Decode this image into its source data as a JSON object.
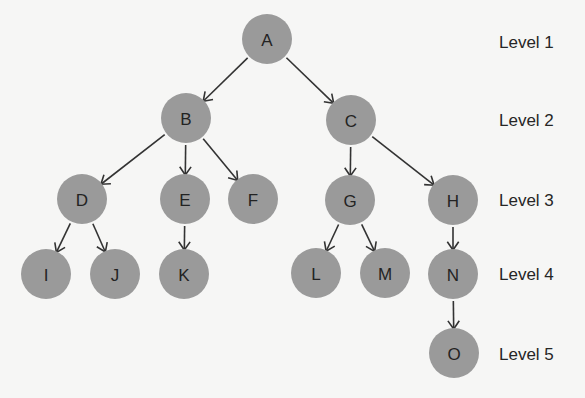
{
  "diagram": {
    "type": "tree",
    "node_radius": 25,
    "colors": {
      "background": "#f6f6f5",
      "node_fill": "#9a9a9a",
      "node_text": "#232323",
      "edge": "#333333",
      "label_text": "#262626"
    },
    "nodes": [
      {
        "id": "A",
        "label": "A",
        "level": 1,
        "x": 267,
        "y": 39
      },
      {
        "id": "B",
        "label": "B",
        "level": 2,
        "x": 186,
        "y": 118
      },
      {
        "id": "C",
        "label": "C",
        "level": 2,
        "x": 351,
        "y": 120
      },
      {
        "id": "D",
        "label": "D",
        "level": 3,
        "x": 82,
        "y": 199
      },
      {
        "id": "E",
        "label": "E",
        "level": 3,
        "x": 185,
        "y": 199
      },
      {
        "id": "F",
        "label": "F",
        "level": 3,
        "x": 253,
        "y": 199
      },
      {
        "id": "G",
        "label": "G",
        "level": 3,
        "x": 350,
        "y": 200
      },
      {
        "id": "H",
        "label": "H",
        "level": 3,
        "x": 453,
        "y": 200
      },
      {
        "id": "I",
        "label": "I",
        "level": 4,
        "x": 46,
        "y": 274
      },
      {
        "id": "J",
        "label": "J",
        "level": 4,
        "x": 115,
        "y": 274
      },
      {
        "id": "K",
        "label": "K",
        "level": 4,
        "x": 184,
        "y": 274
      },
      {
        "id": "L",
        "label": "L",
        "level": 4,
        "x": 316,
        "y": 273
      },
      {
        "id": "M",
        "label": "M",
        "level": 4,
        "x": 385,
        "y": 273
      },
      {
        "id": "N",
        "label": "N",
        "level": 4,
        "x": 453,
        "y": 274
      },
      {
        "id": "O",
        "label": "O",
        "level": 5,
        "x": 454,
        "y": 353
      }
    ],
    "edges": [
      {
        "from": "A",
        "to": "B"
      },
      {
        "from": "A",
        "to": "C"
      },
      {
        "from": "B",
        "to": "D"
      },
      {
        "from": "B",
        "to": "E"
      },
      {
        "from": "B",
        "to": "F"
      },
      {
        "from": "C",
        "to": "G"
      },
      {
        "from": "C",
        "to": "H"
      },
      {
        "from": "D",
        "to": "I"
      },
      {
        "from": "D",
        "to": "J"
      },
      {
        "from": "E",
        "to": "K"
      },
      {
        "from": "G",
        "to": "L"
      },
      {
        "from": "G",
        "to": "M"
      },
      {
        "from": "H",
        "to": "N"
      },
      {
        "from": "N",
        "to": "O"
      }
    ],
    "levels": [
      {
        "label": "Level 1",
        "y": 43
      },
      {
        "label": "Level 2",
        "y": 121
      },
      {
        "label": "Level 3",
        "y": 201
      },
      {
        "label": "Level 4",
        "y": 275
      },
      {
        "label": "Level 5",
        "y": 355
      }
    ]
  }
}
